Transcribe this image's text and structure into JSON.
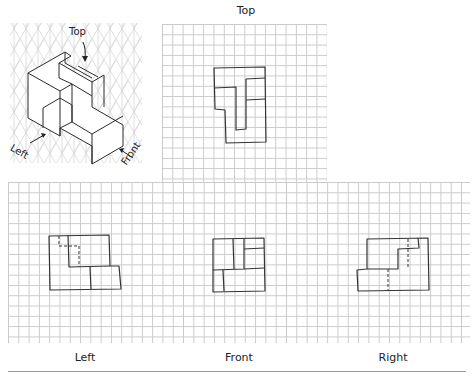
{
  "labels": {
    "top": "Top",
    "left": "Left",
    "front": "Front",
    "right": "Right"
  },
  "isometric": {
    "arrow_labels": {
      "top": "Top",
      "left": "Left",
      "front": "Front"
    }
  },
  "colors": {
    "grid_line": "#c9c9c9",
    "sketch_line": "#3a3a3a",
    "background": "#ffffff"
  }
}
